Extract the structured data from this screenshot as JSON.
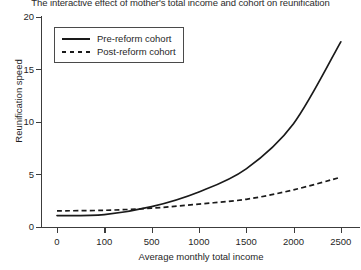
{
  "chart_data": {
    "type": "line",
    "title": "The interactive effect of mother's total income and cohort on reunification",
    "xlabel": "Average monthly total income",
    "ylabel": "Reunification speed",
    "x_tick_labels": [
      "0",
      "100",
      "500",
      "1000",
      "1500",
      "2000",
      "2500"
    ],
    "x_tick_values": [
      0,
      100,
      500,
      1000,
      1500,
      2000,
      2500
    ],
    "x_axis_scale": "ordinal-evenly-spaced",
    "y_tick_labels": [
      "0",
      "5",
      "10",
      "15",
      "20"
    ],
    "y_tick_values": [
      0,
      5,
      10,
      15,
      20
    ],
    "ylim": [
      0,
      20
    ],
    "grid": false,
    "legend_position": "top-left",
    "categories": [
      "0",
      "100",
      "500",
      "1000",
      "1500",
      "2000",
      "2500"
    ],
    "series": [
      {
        "name": "Pre-reform cohort",
        "style": "solid",
        "color": "#1a1a1a",
        "values": [
          1.05,
          1.15,
          1.9,
          3.3,
          5.5,
          9.8,
          17.6
        ]
      },
      {
        "name": "Post-reform cohort",
        "style": "dashed",
        "color": "#1a1a1a",
        "values": [
          1.5,
          1.55,
          1.75,
          2.15,
          2.6,
          3.5,
          4.7
        ]
      }
    ]
  },
  "legend": {
    "items": [
      {
        "label": "Pre-reform cohort",
        "style": "solid"
      },
      {
        "label": "Post-reform cohort",
        "style": "dashed"
      }
    ]
  },
  "axes": {
    "y_labels": [
      "20",
      "15",
      "10",
      "5",
      "0"
    ],
    "x_labels": [
      "0",
      "100",
      "500",
      "1000",
      "1500",
      "2000",
      "2500"
    ]
  }
}
